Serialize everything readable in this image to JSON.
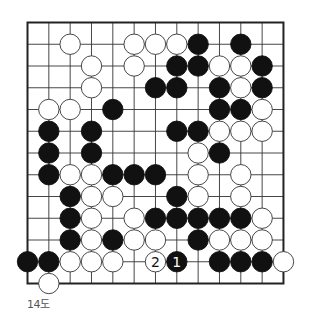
{
  "diagram": {
    "caption": "14도",
    "grid": {
      "cols": 13,
      "rows": 13,
      "origin_x": 27.5,
      "origin_y": 22.5,
      "step_x": 21.33,
      "step_y": 21.75
    },
    "colors": {
      "black": "#111111",
      "white": "#ffffff",
      "line": "#333333",
      "border": "#222222"
    },
    "stones": [
      {
        "r": 1,
        "c": 2,
        "color": "W"
      },
      {
        "r": 1,
        "c": 5,
        "color": "W"
      },
      {
        "r": 1,
        "c": 6,
        "color": "W"
      },
      {
        "r": 1,
        "c": 7,
        "color": "W"
      },
      {
        "r": 1,
        "c": 8,
        "color": "B"
      },
      {
        "r": 1,
        "c": 10,
        "color": "B"
      },
      {
        "r": 2,
        "c": 3,
        "color": "W"
      },
      {
        "r": 2,
        "c": 5,
        "color": "W"
      },
      {
        "r": 2,
        "c": 7,
        "color": "B"
      },
      {
        "r": 2,
        "c": 8,
        "color": "B"
      },
      {
        "r": 2,
        "c": 9,
        "color": "W"
      },
      {
        "r": 2,
        "c": 10,
        "color": "W"
      },
      {
        "r": 2,
        "c": 11,
        "color": "B"
      },
      {
        "r": 3,
        "c": 3,
        "color": "W"
      },
      {
        "r": 3,
        "c": 6,
        "color": "B"
      },
      {
        "r": 3,
        "c": 7,
        "color": "B"
      },
      {
        "r": 3,
        "c": 9,
        "color": "B"
      },
      {
        "r": 3,
        "c": 10,
        "color": "W"
      },
      {
        "r": 3,
        "c": 11,
        "color": "B"
      },
      {
        "r": 4,
        "c": 1,
        "color": "W"
      },
      {
        "r": 4,
        "c": 2,
        "color": "W"
      },
      {
        "r": 4,
        "c": 4,
        "color": "B"
      },
      {
        "r": 4,
        "c": 9,
        "color": "B"
      },
      {
        "r": 4,
        "c": 10,
        "color": "B"
      },
      {
        "r": 4,
        "c": 11,
        "color": "W"
      },
      {
        "r": 5,
        "c": 1,
        "color": "B"
      },
      {
        "r": 5,
        "c": 3,
        "color": "B"
      },
      {
        "r": 5,
        "c": 7,
        "color": "B"
      },
      {
        "r": 5,
        "c": 8,
        "color": "B"
      },
      {
        "r": 5,
        "c": 9,
        "color": "W"
      },
      {
        "r": 5,
        "c": 10,
        "color": "W"
      },
      {
        "r": 5,
        "c": 11,
        "color": "W"
      },
      {
        "r": 6,
        "c": 1,
        "color": "B"
      },
      {
        "r": 6,
        "c": 3,
        "color": "B"
      },
      {
        "r": 6,
        "c": 8,
        "color": "W"
      },
      {
        "r": 6,
        "c": 9,
        "color": "B"
      },
      {
        "r": 7,
        "c": 1,
        "color": "B"
      },
      {
        "r": 7,
        "c": 2,
        "color": "W"
      },
      {
        "r": 7,
        "c": 3,
        "color": "W"
      },
      {
        "r": 7,
        "c": 4,
        "color": "B"
      },
      {
        "r": 7,
        "c": 5,
        "color": "B"
      },
      {
        "r": 7,
        "c": 6,
        "color": "B"
      },
      {
        "r": 7,
        "c": 8,
        "color": "W"
      },
      {
        "r": 7,
        "c": 10,
        "color": "W"
      },
      {
        "r": 8,
        "c": 2,
        "color": "B"
      },
      {
        "r": 8,
        "c": 3,
        "color": "W"
      },
      {
        "r": 8,
        "c": 4,
        "color": "W"
      },
      {
        "r": 8,
        "c": 7,
        "color": "B"
      },
      {
        "r": 8,
        "c": 8,
        "color": "W"
      },
      {
        "r": 8,
        "c": 10,
        "color": "W"
      },
      {
        "r": 9,
        "c": 2,
        "color": "B"
      },
      {
        "r": 9,
        "c": 3,
        "color": "W"
      },
      {
        "r": 9,
        "c": 5,
        "color": "W"
      },
      {
        "r": 9,
        "c": 6,
        "color": "B"
      },
      {
        "r": 9,
        "c": 7,
        "color": "B"
      },
      {
        "r": 9,
        "c": 8,
        "color": "B"
      },
      {
        "r": 9,
        "c": 9,
        "color": "B"
      },
      {
        "r": 9,
        "c": 10,
        "color": "B"
      },
      {
        "r": 9,
        "c": 11,
        "color": "W"
      },
      {
        "r": 10,
        "c": 2,
        "color": "B"
      },
      {
        "r": 10,
        "c": 3,
        "color": "W"
      },
      {
        "r": 10,
        "c": 4,
        "color": "B"
      },
      {
        "r": 10,
        "c": 5,
        "color": "W"
      },
      {
        "r": 10,
        "c": 6,
        "color": "W"
      },
      {
        "r": 10,
        "c": 8,
        "color": "B"
      },
      {
        "r": 10,
        "c": 9,
        "color": "W"
      },
      {
        "r": 10,
        "c": 10,
        "color": "W"
      },
      {
        "r": 10,
        "c": 11,
        "color": "W"
      },
      {
        "r": 11,
        "c": 0,
        "color": "B"
      },
      {
        "r": 11,
        "c": 1,
        "color": "B"
      },
      {
        "r": 11,
        "c": 2,
        "color": "W"
      },
      {
        "r": 11,
        "c": 3,
        "color": "W"
      },
      {
        "r": 11,
        "c": 4,
        "color": "W"
      },
      {
        "r": 11,
        "c": 6,
        "color": "W",
        "label": "2"
      },
      {
        "r": 11,
        "c": 7,
        "color": "B",
        "label": "1"
      },
      {
        "r": 11,
        "c": 9,
        "color": "B"
      },
      {
        "r": 11,
        "c": 10,
        "color": "B"
      },
      {
        "r": 11,
        "c": 11,
        "color": "B"
      },
      {
        "r": 11,
        "c": 12,
        "color": "W"
      },
      {
        "r": 12,
        "c": 1,
        "color": "W"
      }
    ]
  }
}
